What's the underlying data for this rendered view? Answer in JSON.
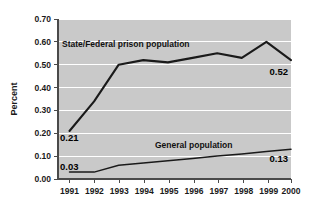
{
  "chart_data": {
    "type": "line",
    "title": "",
    "xlabel": "",
    "ylabel": "Percent",
    "categories": [
      "1991",
      "1992",
      "1993",
      "1994",
      "1995",
      "1996",
      "1997",
      "1998",
      "1999",
      "2000"
    ],
    "ylim": [
      0.0,
      0.7
    ],
    "ytick_labels": [
      "0.70",
      "0.60",
      "0.50",
      "0.40",
      "0.30",
      "0.20",
      "0.10",
      "0.00"
    ],
    "ytick_values": [
      0.7,
      0.6,
      0.5,
      0.4,
      0.3,
      0.2,
      0.1,
      0.0
    ],
    "grid": true,
    "legend": "inline-labels",
    "series": [
      {
        "name": "State/Federal prison population",
        "values": [
          0.21,
          0.34,
          0.5,
          0.52,
          0.51,
          0.53,
          0.55,
          0.53,
          0.6,
          0.52
        ],
        "start_label": "0.21",
        "end_label": "0.52"
      },
      {
        "name": "General population",
        "values": [
          0.03,
          0.03,
          0.06,
          0.07,
          0.08,
          0.09,
          0.1,
          0.11,
          0.12,
          0.13
        ],
        "start_label": "0.03",
        "end_label": "0.13"
      }
    ],
    "annotations": [
      {
        "text": "State/Federal prison population",
        "series": 0
      },
      {
        "text": "General population",
        "series": 1
      }
    ]
  },
  "axis": {
    "y_title": "Percent"
  },
  "labels": {
    "prison_series": "State/Federal prison population",
    "general_series": "General population",
    "prison_start": "0.21",
    "prison_end": "0.52",
    "general_start": "0.03",
    "general_end": "0.13",
    "y0": "0.70",
    "y1": "0.60",
    "y2": "0.50",
    "y3": "0.40",
    "y4": "0.30",
    "y5": "0.20",
    "y6": "0.10",
    "y7": "0.00",
    "x0": "1991",
    "x1": "1992",
    "x2": "1993",
    "x3": "1994",
    "x4": "1995",
    "x5": "1996",
    "x6": "1997",
    "x7": "1998",
    "x8": "1999",
    "x9": "2000"
  },
  "colors": {
    "plot_background": "#c9c9c9",
    "gridlines": "#ffffff",
    "series_line": "#1a1a1a",
    "axis": "#4a4a4a",
    "text": "#111111",
    "page_background": "#ffffff"
  }
}
